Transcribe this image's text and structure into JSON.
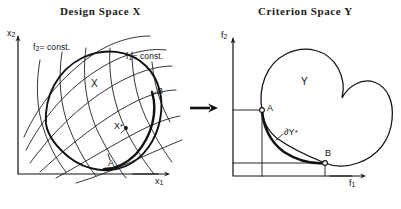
{
  "figure": {
    "type": "diagram",
    "background_color": "#ffffff",
    "ink_color": "#111111"
  },
  "panels": {
    "left": {
      "title": "Design Space  X",
      "axis_x_label": "x",
      "axis_x_sub": "1",
      "axis_y_label": "x",
      "axis_y_sub": "2",
      "region_label": "X",
      "contour_label_1": "f",
      "contour_sub_1": "1",
      "contour_eq_1": "= const.",
      "contour_label_2": "f",
      "contour_sub_2": "2",
      "contour_eq_2": "= const.",
      "point_a": "A",
      "point_b": "B",
      "point_star": "X",
      "point_star_sup": "*"
    },
    "right": {
      "title": "Criterion Space  Y",
      "axis_x_label": "f",
      "axis_x_sub": "1",
      "axis_y_label": "f",
      "axis_y_sub": "2",
      "region_label": "Y",
      "point_a": "A",
      "point_b": "B",
      "frontier_label": "∂Y",
      "frontier_sup": "*"
    }
  },
  "mapping_arrow": {
    "name": "mapping-arrow",
    "direction": "left-to-right"
  }
}
